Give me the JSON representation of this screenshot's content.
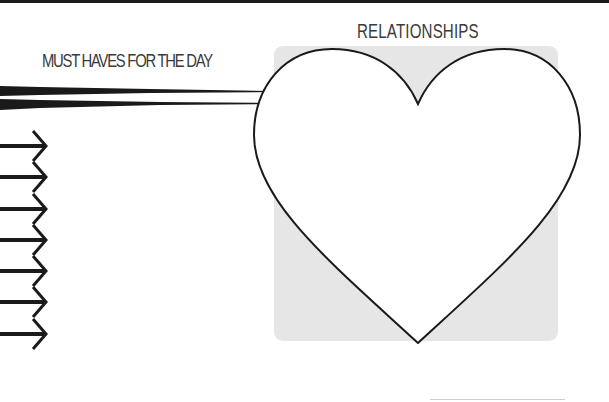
{
  "page": {
    "left_heading": "MUST HAVES FOR THE DAY",
    "right_heading": "RELATIONSHIPS",
    "arrow_count": 7,
    "icons": {
      "arrow": "right-arrow-icon",
      "heart": "heart-icon",
      "brush_strokes": "brush-stroke-icon"
    },
    "colors": {
      "ink": "#1a1a1a",
      "heading_text": "#3a3a3a",
      "panel_fill": "#e6e6e6",
      "background": "#ffffff"
    }
  }
}
